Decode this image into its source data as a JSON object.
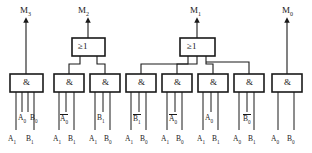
{
  "diagram": {
    "outputs": [
      {
        "name": "M3",
        "base": "M",
        "sub": "3",
        "x": 20,
        "y": 6
      },
      {
        "name": "M2",
        "base": "M",
        "sub": "2",
        "x": 78,
        "y": 6
      },
      {
        "name": "M1",
        "base": "M",
        "sub": "1",
        "x": 190,
        "y": 6
      },
      {
        "name": "M0",
        "base": "M",
        "sub": "0",
        "x": 282,
        "y": 6
      }
    ],
    "or_gates": [
      {
        "name": "or-gate-m2",
        "symbol": "≥1",
        "x": 72,
        "y": 38,
        "w": 33,
        "h": 18,
        "inputs": 2
      },
      {
        "name": "or-gate-m1",
        "symbol": "≥1",
        "x": 180,
        "y": 38,
        "w": 35,
        "h": 18,
        "inputs": 3
      }
    ],
    "and_gates": [
      {
        "name": "and-gate-1",
        "symbol": "&",
        "x": 10,
        "y": 74,
        "w": 33,
        "h": 18,
        "inputs": 4
      },
      {
        "name": "and-gate-2",
        "symbol": "&",
        "x": 54,
        "y": 74,
        "w": 30,
        "h": 18,
        "inputs": 3
      },
      {
        "name": "and-gate-3",
        "symbol": "&",
        "x": 90,
        "y": 74,
        "w": 30,
        "h": 18,
        "inputs": 3
      },
      {
        "name": "and-gate-4",
        "symbol": "&",
        "x": 126,
        "y": 74,
        "w": 30,
        "h": 18,
        "inputs": 3
      },
      {
        "name": "and-gate-5",
        "symbol": "&",
        "x": 162,
        "y": 74,
        "w": 30,
        "h": 18,
        "inputs": 3
      },
      {
        "name": "and-gate-6",
        "symbol": "&",
        "x": 198,
        "y": 74,
        "w": 30,
        "h": 18,
        "inputs": 3
      },
      {
        "name": "and-gate-7",
        "symbol": "&",
        "x": 234,
        "y": 74,
        "w": 30,
        "h": 18,
        "inputs": 3
      },
      {
        "name": "and-gate-8",
        "symbol": "&",
        "x": 272,
        "y": 74,
        "w": 30,
        "h": 18,
        "inputs": 2
      }
    ],
    "input_labels_upper": [
      {
        "name": "in-up-1a",
        "base": "A",
        "sub": "0",
        "overline": false,
        "x": 18,
        "y": 114
      },
      {
        "name": "in-up-1b",
        "base": "B",
        "sub": "0",
        "overline": false,
        "x": 30,
        "y": 114
      },
      {
        "name": "in-up-2",
        "base": "A",
        "sub": "0",
        "overline": true,
        "x": 60,
        "y": 114
      },
      {
        "name": "in-up-3",
        "base": "B",
        "sub": "1",
        "overline": false,
        "x": 97,
        "y": 114
      },
      {
        "name": "in-up-4",
        "base": "B",
        "sub": "1",
        "overline": true,
        "x": 133,
        "y": 114
      },
      {
        "name": "in-up-5",
        "base": "A",
        "sub": "0",
        "overline": true,
        "x": 169,
        "y": 114
      },
      {
        "name": "in-up-6",
        "base": "A",
        "sub": "0",
        "overline": false,
        "x": 205,
        "y": 114
      },
      {
        "name": "in-up-7",
        "base": "B",
        "sub": "0",
        "overline": true,
        "x": 243,
        "y": 114
      }
    ],
    "input_labels_lower": [
      {
        "name": "in-lo-1a",
        "base": "A",
        "sub": "1",
        "overline": false,
        "x": 8,
        "y": 135
      },
      {
        "name": "in-lo-1b",
        "base": "B",
        "sub": "1",
        "overline": false,
        "x": 26,
        "y": 135
      },
      {
        "name": "in-lo-2a",
        "base": "A",
        "sub": "1",
        "overline": false,
        "x": 53,
        "y": 135
      },
      {
        "name": "in-lo-2b",
        "base": "B",
        "sub": "1",
        "overline": false,
        "x": 68,
        "y": 135
      },
      {
        "name": "in-lo-3a",
        "base": "A",
        "sub": "1",
        "overline": false,
        "x": 89,
        "y": 135
      },
      {
        "name": "in-lo-3b",
        "base": "B",
        "sub": "0",
        "overline": false,
        "x": 104,
        "y": 135
      },
      {
        "name": "in-lo-4a",
        "base": "A",
        "sub": "1",
        "overline": false,
        "x": 125,
        "y": 135
      },
      {
        "name": "in-lo-4b",
        "base": "B",
        "sub": "0",
        "overline": false,
        "x": 140,
        "y": 135
      },
      {
        "name": "in-lo-5a",
        "base": "A",
        "sub": "1",
        "overline": false,
        "x": 161,
        "y": 135
      },
      {
        "name": "in-lo-5b",
        "base": "B",
        "sub": "0",
        "overline": false,
        "x": 176,
        "y": 135
      },
      {
        "name": "in-lo-6a",
        "base": "A",
        "sub": "1",
        "overline": false,
        "x": 197,
        "y": 135
      },
      {
        "name": "in-lo-6b",
        "base": "B",
        "sub": "1",
        "overline": false,
        "x": 212,
        "y": 135
      },
      {
        "name": "in-lo-7a",
        "base": "A",
        "sub": "0",
        "overline": false,
        "x": 233,
        "y": 135
      },
      {
        "name": "in-lo-7b",
        "base": "B",
        "sub": "1",
        "overline": false,
        "x": 248,
        "y": 135
      },
      {
        "name": "in-lo-8a",
        "base": "A",
        "sub": "0",
        "overline": false,
        "x": 271,
        "y": 135
      },
      {
        "name": "in-lo-8b",
        "base": "B",
        "sub": "0",
        "overline": false,
        "x": 287,
        "y": 135
      }
    ],
    "colors": {
      "stroke": "#1a1a1a",
      "gate_fill": "#ffffff",
      "background": "#ffffff"
    }
  }
}
